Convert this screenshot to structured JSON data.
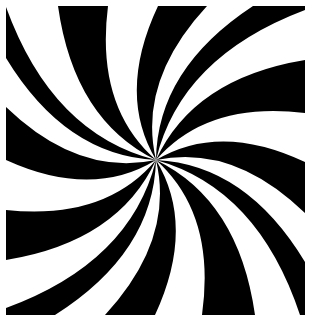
{
  "image": {
    "width": 309,
    "height": 323,
    "background": "#ffffff",
    "foreground": "#000000",
    "description": "Black and white swirl / spiral pattern"
  },
  "swirl": {
    "center": [
      156,
      160
    ],
    "frame": {
      "x0": 6,
      "y0": 6,
      "x1": 305,
      "y1": 315
    },
    "arm_count": 12,
    "curl": 0.55,
    "arms": [
      {
        "a": [
          6,
          7
        ],
        "b": [
          6,
          58
        ]
      },
      {
        "a": [
          6,
          107
        ],
        "b": [
          6,
          160
        ]
      },
      {
        "a": [
          6,
          210
        ],
        "b": [
          6,
          260
        ]
      },
      {
        "a": [
          6,
          308
        ],
        "b": [
          55,
          315
        ]
      },
      {
        "a": [
          105,
          315
        ],
        "b": [
          155,
          315
        ]
      },
      {
        "a": [
          202,
          315
        ],
        "b": [
          255,
          315
        ]
      },
      {
        "a": [
          300,
          315
        ],
        "b": [
          305,
          262
        ]
      },
      {
        "a": [
          305,
          213
        ],
        "b": [
          305,
          162
        ]
      },
      {
        "a": [
          305,
          113
        ],
        "b": [
          305,
          60
        ]
      },
      {
        "a": [
          305,
          10
        ],
        "b": [
          253,
          6
        ]
      },
      {
        "a": [
          207,
          6
        ],
        "b": [
          158,
          6
        ]
      },
      {
        "a": [
          108,
          6
        ],
        "b": [
          58,
          6
        ]
      }
    ]
  }
}
